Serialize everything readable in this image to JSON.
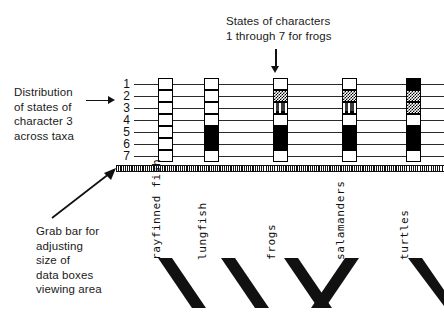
{
  "annotations": {
    "top": "States of characters\n1 through 7 for frogs",
    "left": "Distribution\nof states of\ncharacter 3\nacross taxa",
    "bottom": "Grab bar for\nadjusting\nsize of\ndata boxes\nviewing area"
  },
  "matrix": {
    "row_labels": [
      "1",
      "2",
      "3",
      "4",
      "5",
      "6",
      "7"
    ],
    "taxa": [
      "rayfinned fish",
      "lungfish",
      "frogs",
      "salamanders",
      "turtles"
    ],
    "states": [
      [
        "white",
        "white",
        "white",
        "white",
        "black"
      ],
      [
        "white",
        "white",
        "checker",
        "checker",
        "checker"
      ],
      [
        "white",
        "white",
        "poly",
        "poly",
        "checker"
      ],
      [
        "white",
        "white",
        "white",
        "white",
        "white"
      ],
      [
        "white",
        "black",
        "black",
        "black",
        "black"
      ],
      [
        "white",
        "black",
        "black",
        "black",
        "black"
      ],
      [
        "white",
        "white",
        "white",
        "white",
        "white"
      ]
    ]
  },
  "grab_bar": {
    "label": "grab-bar"
  },
  "colors": {
    "ink": "#111111",
    "box_border": "#000000",
    "box_fill_state0": "#ffffff",
    "box_fill_state1": "#000000",
    "line": "#2a2a2a"
  }
}
